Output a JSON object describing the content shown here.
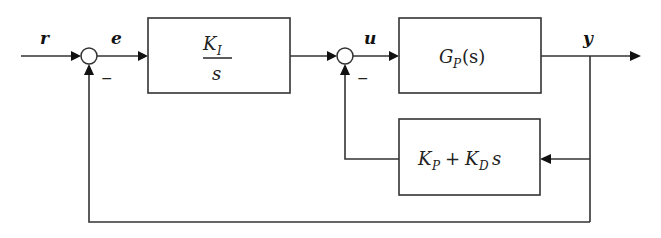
{
  "diagram": {
    "type": "feedback control block diagram",
    "signals": {
      "reference": "r",
      "error": "e",
      "control": "u",
      "output": "y"
    },
    "summing_junctions": [
      {
        "id": "sum1",
        "inputs": [
          "r",
          "-y"
        ],
        "output": "e",
        "negative_sign": "−"
      },
      {
        "id": "sum2",
        "inputs": [
          "integrator_output",
          "-(K_P + K_D s) y"
        ],
        "output": "u",
        "negative_sign": "−"
      }
    ],
    "blocks": {
      "integrator": {
        "numerator": "K",
        "numerator_sub": "I",
        "denominator": "s"
      },
      "plant": {
        "main": "G",
        "sub": "P",
        "arg": "(s)"
      },
      "feedback": {
        "k1": "K",
        "k1_sub": "P",
        "plus": "+",
        "k2": "K",
        "k2_sub": "D",
        "var": "s"
      }
    },
    "colors": {
      "line": "#333333",
      "arrow": "#111111",
      "background": "#ffffff"
    }
  }
}
